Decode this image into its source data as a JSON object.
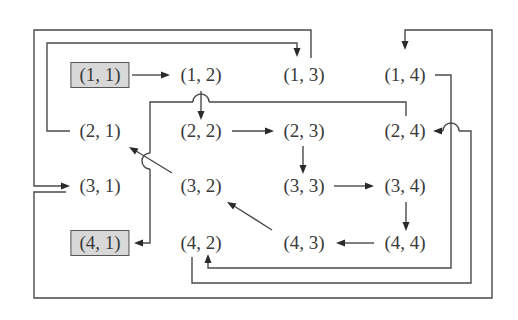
{
  "diagram": {
    "type": "grid-traversal-path",
    "start_cell": "(1, 1)",
    "end_cell": "(4, 1)",
    "highlight_color": "#d8d8d8",
    "line_color": "#4a4a4a",
    "nodes": [
      {
        "id": "n11",
        "label": "(1, 1)",
        "row": 1,
        "col": 1,
        "highlighted": true
      },
      {
        "id": "n12",
        "label": "(1, 2)",
        "row": 1,
        "col": 2,
        "highlighted": false
      },
      {
        "id": "n13",
        "label": "(1, 3)",
        "row": 1,
        "col": 3,
        "highlighted": false
      },
      {
        "id": "n14",
        "label": "(1, 4)",
        "row": 1,
        "col": 4,
        "highlighted": false
      },
      {
        "id": "n21",
        "label": "(2, 1)",
        "row": 2,
        "col": 1,
        "highlighted": false
      },
      {
        "id": "n22",
        "label": "(2, 2)",
        "row": 2,
        "col": 2,
        "highlighted": false
      },
      {
        "id": "n23",
        "label": "(2, 3)",
        "row": 2,
        "col": 3,
        "highlighted": false
      },
      {
        "id": "n24",
        "label": "(2, 4)",
        "row": 2,
        "col": 4,
        "highlighted": false
      },
      {
        "id": "n31",
        "label": "(3, 1)",
        "row": 3,
        "col": 1,
        "highlighted": false
      },
      {
        "id": "n32",
        "label": "(3, 2)",
        "row": 3,
        "col": 2,
        "highlighted": false
      },
      {
        "id": "n33",
        "label": "(3, 3)",
        "row": 3,
        "col": 3,
        "highlighted": false
      },
      {
        "id": "n34",
        "label": "(3, 4)",
        "row": 3,
        "col": 4,
        "highlighted": false
      },
      {
        "id": "n41",
        "label": "(4, 1)",
        "row": 4,
        "col": 1,
        "highlighted": true
      },
      {
        "id": "n42",
        "label": "(4, 2)",
        "row": 4,
        "col": 2,
        "highlighted": false
      },
      {
        "id": "n43",
        "label": "(4, 3)",
        "row": 4,
        "col": 3,
        "highlighted": false
      },
      {
        "id": "n44",
        "label": "(4, 4)",
        "row": 4,
        "col": 4,
        "highlighted": false
      }
    ],
    "edges": [
      {
        "from": "(1, 1)",
        "to": "(1, 2)"
      },
      {
        "from": "(1, 2)",
        "to": "(2, 2)"
      },
      {
        "from": "(2, 2)",
        "to": "(2, 3)"
      },
      {
        "from": "(2, 3)",
        "to": "(3, 3)"
      },
      {
        "from": "(3, 3)",
        "to": "(3, 4)"
      },
      {
        "from": "(3, 4)",
        "to": "(4, 4)"
      },
      {
        "from": "(4, 4)",
        "to": "(4, 3)"
      },
      {
        "from": "(4, 3)",
        "to": "(3, 2)"
      },
      {
        "from": "(3, 2)",
        "to": "(2, 1)"
      },
      {
        "from": "(2, 1)",
        "to": "(1, 3)"
      },
      {
        "from": "(1, 3)",
        "to": "(3, 1)"
      },
      {
        "from": "(3, 1)",
        "to": "(1, 4)"
      },
      {
        "from": "(1, 4)",
        "to": "(4, 2)"
      },
      {
        "from": "(4, 2)",
        "to": "(2, 4)"
      },
      {
        "from": "(2, 4)",
        "to": "(4, 1)"
      }
    ]
  }
}
